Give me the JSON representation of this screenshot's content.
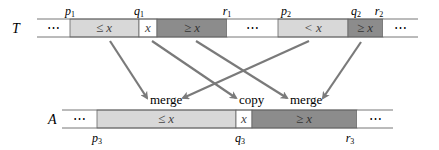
{
  "diagram": {
    "colors": {
      "light_fill": "#d8d8d8",
      "dark_fill": "#8c8c8c",
      "white_fill": "#ffffff",
      "border": "#555555",
      "arrow": "#7a7a7a",
      "text": "#222222"
    },
    "top_array": {
      "name": "T",
      "cells": [
        {
          "label": "⋯",
          "fill": "white"
        },
        {
          "label": "≤ x",
          "fill": "light"
        },
        {
          "label": "x",
          "fill": "white"
        },
        {
          "label": "≥ x",
          "fill": "dark"
        },
        {
          "label": "⋯",
          "fill": "white"
        },
        {
          "label": "< x",
          "fill": "light"
        },
        {
          "label": "≥ x",
          "fill": "dark"
        },
        {
          "label": "⋯",
          "fill": "white"
        }
      ],
      "index_labels": {
        "p1": "p",
        "p1_sub": "1",
        "q1": "q",
        "q1_sub": "1",
        "r1": "r",
        "r1_sub": "1",
        "p2": "p",
        "p2_sub": "2",
        "q2": "q",
        "q2_sub": "2",
        "r2": "r",
        "r2_sub": "2"
      }
    },
    "bottom_array": {
      "name": "A",
      "cells": [
        {
          "label": "⋯",
          "fill": "white"
        },
        {
          "label": "≤ x",
          "fill": "light"
        },
        {
          "label": "x",
          "fill": "white"
        },
        {
          "label": "≥ x",
          "fill": "dark"
        },
        {
          "label": "⋯",
          "fill": "white"
        }
      ],
      "index_labels": {
        "p3": "p",
        "p3_sub": "3",
        "q3": "q",
        "q3_sub": "3",
        "r3": "r",
        "r3_sub": "3"
      }
    },
    "operations": {
      "merge_left": "merge",
      "copy": "copy",
      "merge_right": "merge"
    }
  }
}
